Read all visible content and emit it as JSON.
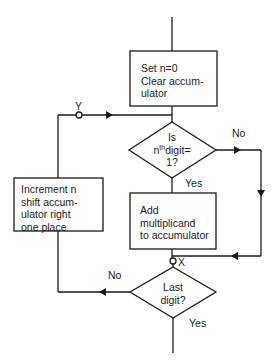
{
  "diagram": {
    "type": "flowchart",
    "nodes": {
      "init": {
        "shape": "process",
        "lines": [
          "Set n=0",
          "Clear accum-",
          "ulator"
        ]
      },
      "test_digit": {
        "shape": "decision",
        "line1": "Is",
        "line2_pre": "n",
        "line2_sup": "th",
        "line2_post": "digit=",
        "line3": "1?"
      },
      "add": {
        "shape": "process",
        "lines": [
          "Add",
          "multiplicand",
          "to accumulator"
        ]
      },
      "last_digit": {
        "shape": "decision",
        "lines": [
          "Last",
          "digit?"
        ]
      },
      "increment": {
        "shape": "process",
        "lines": [
          "Increment n",
          "shift accum-",
          "ulator right",
          "one place"
        ]
      }
    },
    "connectors": {
      "y_label": "Y",
      "x_label": "X"
    },
    "edge_labels": {
      "test_no": "No",
      "test_yes": "Yes",
      "last_no": "No",
      "last_yes": "Yes"
    },
    "colors": {
      "line": "#1a1a1a",
      "background": "#ffffff"
    }
  }
}
